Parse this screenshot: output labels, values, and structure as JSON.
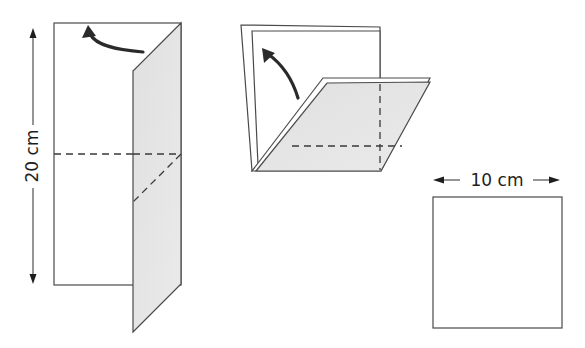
{
  "diagram": {
    "type": "paper-folding-instructions",
    "steps": [
      {
        "id": "step-1",
        "description": "Tall rectangular sheet with right strip folded forward; curved arrow indicates folding back",
        "dimension_label": "20 cm",
        "dimension_orientation": "vertical"
      },
      {
        "id": "step-2",
        "description": "Sheet folded with lower portion folded diagonally forward as a parallelogram; curved arrow indicates folding up"
      },
      {
        "id": "step-3",
        "description": "Resulting square sheet",
        "dimension_label": "10 cm",
        "dimension_orientation": "horizontal"
      }
    ],
    "labels": {
      "height": "20 cm",
      "width": "10 cm"
    },
    "colors": {
      "line": "#4a4a4a",
      "fold_fill": "#e4e4e4",
      "arrow": "#2a2a2a",
      "background": "#ffffff"
    }
  }
}
